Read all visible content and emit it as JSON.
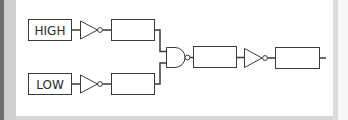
{
  "diagram": {
    "inputs": [
      {
        "label": "HIGH"
      },
      {
        "label": "LOW"
      }
    ],
    "gates": [
      {
        "type": "NOT",
        "name": "inverter-top"
      },
      {
        "type": "NOT",
        "name": "inverter-bottom"
      },
      {
        "type": "NAND",
        "name": "nand-gate"
      },
      {
        "type": "NOT",
        "name": "inverter-output"
      }
    ],
    "boxes": [
      "",
      "",
      "",
      ""
    ],
    "colors": {
      "stroke": "#3a3a3a",
      "panel": "#ffffff",
      "frame_dark": "#6e6e6e",
      "frame_light": "#cfcfcf"
    }
  }
}
